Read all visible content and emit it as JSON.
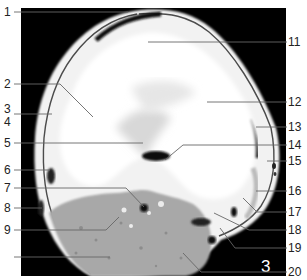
{
  "figure": {
    "panel_number": "3",
    "scan_type": "axial MRI knee cross-section",
    "colors": {
      "background": "#000000",
      "bone": "#fafafa",
      "muscle": "#a9a9a9",
      "fat": "#e8e8e8",
      "leader_line": "#555555",
      "label_text": "#222222"
    },
    "labels_left": [
      {
        "id": "label-1",
        "text": "1"
      },
      {
        "id": "label-2",
        "text": "2"
      },
      {
        "id": "label-3",
        "text": "3"
      },
      {
        "id": "label-4",
        "text": "4"
      },
      {
        "id": "label-5",
        "text": "5"
      },
      {
        "id": "label-6",
        "text": "6"
      },
      {
        "id": "label-7",
        "text": "7"
      },
      {
        "id": "label-8",
        "text": "8"
      },
      {
        "id": "label-9",
        "text": "9"
      }
    ],
    "labels_right": [
      {
        "id": "label-11",
        "text": "11"
      },
      {
        "id": "label-12",
        "text": "12"
      },
      {
        "id": "label-13",
        "text": "13"
      },
      {
        "id": "label-14",
        "text": "14"
      },
      {
        "id": "label-15",
        "text": "15"
      },
      {
        "id": "label-16",
        "text": "16"
      },
      {
        "id": "label-17",
        "text": "17"
      },
      {
        "id": "label-18",
        "text": "18"
      },
      {
        "id": "label-19",
        "text": "19"
      },
      {
        "id": "label-20",
        "text": "20"
      }
    ]
  }
}
